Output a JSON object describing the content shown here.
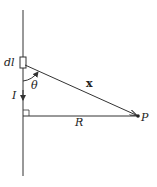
{
  "diagram": {
    "labels": {
      "current_element": "dl",
      "angle": "θ",
      "current": "I",
      "position_vector": "x",
      "distance": "R",
      "point": "P"
    },
    "colors": {
      "line": "#333333",
      "background": "#ffffff"
    }
  }
}
